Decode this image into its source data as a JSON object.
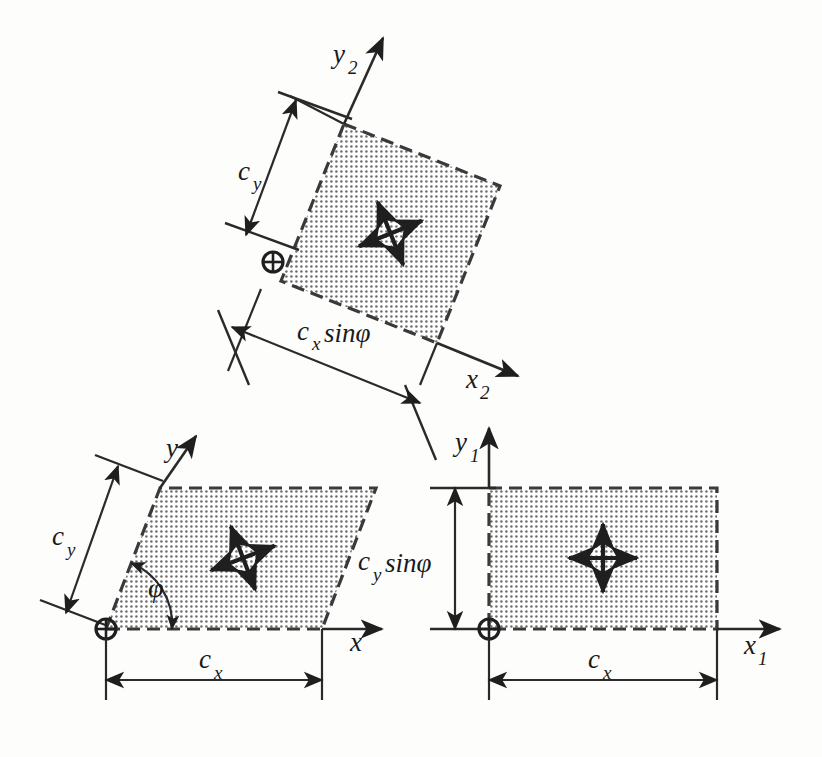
{
  "figure": {
    "background_color": "#fdfdfc",
    "ink_color": "#2a2a2a",
    "fill_pattern": "dotted-stipple",
    "fill_color": "#8a8a8a"
  },
  "panels": [
    {
      "id": "panel-top",
      "name": "rotated-cell",
      "description": "Rotated square cell with axes x2 and y2",
      "axis_x_label": "x",
      "axis_x_sub": "2",
      "axis_y_label": "y",
      "axis_y_sub": "2",
      "dim_vertical_label": "c",
      "dim_vertical_sub": "y",
      "dim_horizontal_label": "c",
      "dim_horizontal_sub": "x",
      "dim_horizontal_suffix": "sinφ",
      "origin_symbol": "⊕",
      "rotation_deg": -21
    },
    {
      "id": "panel-bottom-left",
      "name": "sheared-cell",
      "description": "Sheared parallelogram cell with shear angle phi, axes x and y",
      "axis_x_label": "x",
      "axis_x_sub": "",
      "axis_y_label": "y",
      "axis_y_sub": "",
      "dim_vertical_label": "c",
      "dim_vertical_sub": "y",
      "dim_horizontal_label": "c",
      "dim_horizontal_sub": "x",
      "dim_horizontal_suffix": "",
      "angle_label": "φ",
      "origin_symbol": "⊕",
      "shear_angle_deg": 62
    },
    {
      "id": "panel-bottom-right",
      "name": "rectangular-cell",
      "description": "Orthogonal rectangular cell with axes x1 and y1",
      "axis_x_label": "x",
      "axis_x_sub": "1",
      "axis_y_label": "y",
      "axis_y_sub": "1",
      "dim_vertical_label": "c",
      "dim_vertical_sub": "y",
      "dim_vertical_suffix": "sinφ",
      "dim_horizontal_label": "c",
      "dim_horizontal_sub": "x",
      "dim_horizontal_suffix": "",
      "origin_symbol": "⊕",
      "shear_angle_deg": 90
    }
  ],
  "symbols": {
    "origin_marker": "origin-circle-cross",
    "center_marker": "four-way-arrow-cross",
    "arrow_head": "solid-triangle"
  }
}
